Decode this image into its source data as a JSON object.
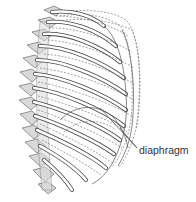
{
  "figure": {
    "labels": [
      {
        "id": "diaphragm",
        "text": "diaphragm"
      }
    ]
  },
  "colors": {
    "line": "#444444",
    "vertebra_fill": "#d9d9d9",
    "background": "#ffffff",
    "label_text": "#333333"
  }
}
